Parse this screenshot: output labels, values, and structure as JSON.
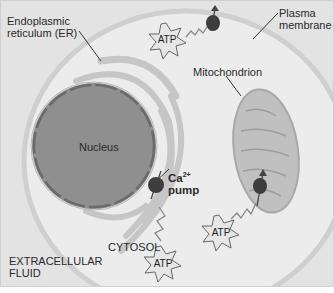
{
  "diagram": {
    "labels": {
      "er_line1": "Endoplasmic",
      "er_line2": "reticulum (ER)",
      "plasma_line1": "Plasma",
      "plasma_line2": "membrane",
      "mitochondrion": "Mitochondrion",
      "nucleus": "Nucleus",
      "ca_pump_line1": "Ca",
      "ca_pump_sup": "2+",
      "ca_pump_line2": "pump",
      "cytosol": "CYTOSOL",
      "extracellular_line1": "EXTRACELLULAR",
      "extracellular_line2": "FLUID"
    },
    "atp_labels": [
      "ATP",
      "ATP",
      "ATP"
    ],
    "colors": {
      "background": "#e3e3e3",
      "cell_interior": "#ececec",
      "membrane": "#cfcfcf",
      "nucleus": "#8e8e8e",
      "nucleus_envelope": "#6e6e6e",
      "er": "#c8c8c8",
      "mitochondrion": "#b8b8b8",
      "pump": "#3a3a3a"
    }
  }
}
